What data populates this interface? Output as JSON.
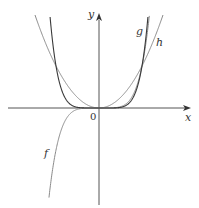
{
  "figure": {
    "axis_labels": {
      "x": "x",
      "y": "y",
      "origin": "0"
    },
    "curve_labels": {
      "f": "f",
      "g": "g",
      "h": "h"
    },
    "colors": {
      "axis": "#555555",
      "curve_light": "#8a8a8a",
      "curve_dark": "#3a3a3a"
    }
  },
  "chart_data": {
    "type": "line",
    "title": "",
    "xlabel": "x",
    "ylabel": "y",
    "origin_label": "0",
    "grid": false,
    "series": [
      {
        "name": "f",
        "expression": "x^5",
        "parity": "odd"
      },
      {
        "name": "g",
        "expression": "x^6",
        "parity": "even"
      },
      {
        "name": "h",
        "expression": "x^2",
        "parity": "even"
      }
    ],
    "intersections": [
      [
        -1,
        1
      ],
      [
        0,
        0
      ],
      [
        1,
        1
      ]
    ],
    "xlim": [
      -2.2,
      2.1
    ],
    "ylim": [
      -2.1,
      2.2
    ]
  }
}
